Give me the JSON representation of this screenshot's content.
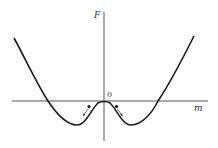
{
  "diagram": {
    "title": "",
    "axes": {
      "x_label": "m",
      "y_label": "F",
      "origin_label": "0"
    },
    "colors": {
      "curve": "#1a1a1a",
      "axis": "#444444",
      "background": "#ffffff"
    },
    "curve_points": [
      [
        14,
        38
      ],
      [
        30,
        68
      ],
      [
        48,
        101
      ],
      [
        62,
        118
      ],
      [
        77,
        125
      ],
      [
        88,
        118
      ],
      [
        96,
        106
      ],
      [
        104,
        101
      ],
      [
        112,
        106
      ],
      [
        120,
        118
      ],
      [
        130,
        125
      ],
      [
        145,
        118
      ],
      [
        158,
        101
      ],
      [
        176,
        70
      ],
      [
        194,
        36
      ]
    ],
    "balls": [
      {
        "position": [
          89,
          106
        ],
        "arrow_to": [
          83,
          116
        ],
        "direction": "down-left"
      },
      {
        "position": [
          117,
          106
        ],
        "arrow_to": [
          123,
          116
        ],
        "direction": "down-right"
      }
    ]
  }
}
